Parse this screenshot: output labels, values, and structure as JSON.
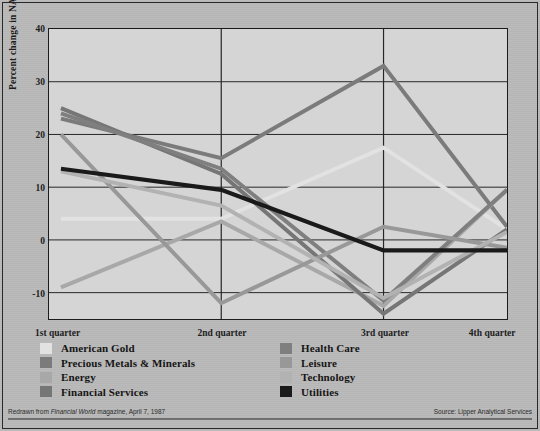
{
  "figure": {
    "background_color": "#b9b9b9",
    "plot_background_color": "#d5d5d5"
  },
  "y_axis_title": "Percent change in NAV",
  "footer": {
    "left_prefix": "Redrawn from ",
    "left_italic": "Financial World",
    "left_suffix": " magazine, April 7, 1987",
    "right": "Source: Lipper Analytical Services"
  },
  "legend": {
    "left_column": [
      {
        "label": "American Gold",
        "color": "#e2e2e2"
      },
      {
        "label": "Precious Metals & Minerals",
        "color": "#7b7b7b"
      },
      {
        "label": "Energy",
        "color": "#a8a8a8"
      },
      {
        "label": "Financial Services",
        "color": "#767676"
      }
    ],
    "right_column": [
      {
        "label": "Health Care",
        "color": "#7f7f7f"
      },
      {
        "label": "Leisure",
        "color": "#989898"
      },
      {
        "label": "Technology",
        "color": "#b2b2b2"
      },
      {
        "label": "Utilities",
        "color": "#1a1a1a"
      }
    ]
  },
  "chart_data": {
    "type": "line",
    "title": "",
    "xlabel": "",
    "ylabel": "Percent change in NAV",
    "categories": [
      "1st quarter",
      "2nd quarter",
      "3rd quarter",
      "4th quarter"
    ],
    "ylim": [
      -15,
      40
    ],
    "yticks": [
      40,
      30,
      20,
      10,
      0,
      -10
    ],
    "grid": true,
    "legend_position": "bottom",
    "series": [
      {
        "name": "American Gold",
        "color": "#e2e2e2",
        "width": 4.0,
        "values": [
          4,
          4,
          17.5,
          2
        ]
      },
      {
        "name": "Precious Metals & Minerals",
        "color": "#7b7b7b",
        "width": 4.0,
        "values": [
          23,
          15.5,
          33,
          2.5
        ]
      },
      {
        "name": "Energy",
        "color": "#a8a8a8",
        "width": 4.0,
        "values": [
          -9,
          3.5,
          -12.5,
          9.5
        ]
      },
      {
        "name": "Financial Services",
        "color": "#767676",
        "width": 4.0,
        "values": [
          25,
          12.5,
          -14,
          2
        ]
      },
      {
        "name": "Health Care",
        "color": "#7f7f7f",
        "width": 4.0,
        "values": [
          24,
          13.5,
          -11.5,
          9.5
        ]
      },
      {
        "name": "Leisure",
        "color": "#989898",
        "width": 4.0,
        "values": [
          20,
          -12,
          2.5,
          -1.5
        ]
      },
      {
        "name": "Technology",
        "color": "#b2b2b2",
        "width": 4.0,
        "values": [
          13,
          6.5,
          -11,
          1.5
        ]
      },
      {
        "name": "Utilities",
        "color": "#1a1a1a",
        "width": 4.2,
        "values": [
          13.5,
          9.5,
          -2,
          -2
        ]
      }
    ]
  }
}
